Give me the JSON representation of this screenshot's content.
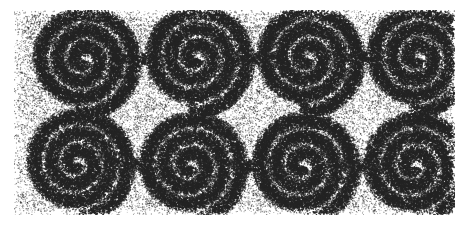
{
  "artwork": {
    "title": "Stippled Interlocking Spiral Frieze",
    "style": "stipple-engraving",
    "medium_note": "dot-stipple shading on white ground",
    "caption": "",
    "canvas": {
      "width": 470,
      "height": 229,
      "background_color": "#ffffff"
    },
    "plate": {
      "x": 14,
      "y": 10,
      "width": 441,
      "height": 205,
      "ground_tone": "#f2f2f2",
      "ink_color": "#1a1a1a"
    },
    "pattern": {
      "type": "double-row-interlocking-spirals",
      "rows": 2,
      "columns": 4,
      "row_spacing": 105,
      "column_spacing": 110,
      "turns_per_spiral": 3.1,
      "band_width": 11,
      "max_radius": 52,
      "connector": "s-curve-tangent"
    },
    "spiral_centers_top": [
      {
        "cx": 83,
        "cy": 60,
        "chirality": "ccw"
      },
      {
        "cx": 196,
        "cy": 58,
        "chirality": "ccw"
      },
      {
        "cx": 307,
        "cy": 58,
        "chirality": "ccw"
      },
      {
        "cx": 417,
        "cy": 58,
        "chirality": "ccw"
      }
    ],
    "spiral_centers_bottom": [
      {
        "cx": 77,
        "cy": 163,
        "chirality": "ccw"
      },
      {
        "cx": 190,
        "cy": 166,
        "chirality": "ccw"
      },
      {
        "cx": 302,
        "cy": 166,
        "chirality": "ccw"
      },
      {
        "cx": 414,
        "cy": 166,
        "chirality": "ccw"
      }
    ],
    "stipple": {
      "dot_count": 165000,
      "dot_radius_min": 0.34,
      "dot_radius_max": 0.95,
      "ground_density": 0.2,
      "ridge_density": 0.92,
      "seed": 20240517
    },
    "tones": {
      "paper": "#ffffff",
      "light_ground": "#ededed",
      "mid_tone": "#9a9a9a",
      "dark_ridge": "#242424"
    }
  }
}
